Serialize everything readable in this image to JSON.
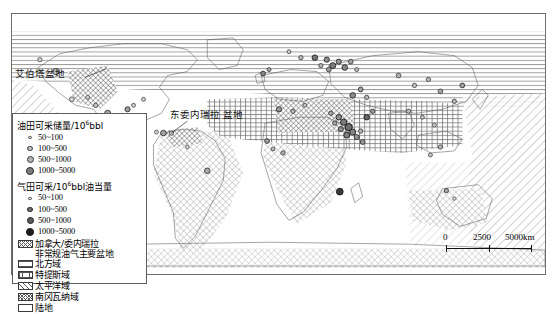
{
  "map": {
    "title_labels": [
      {
        "id": "alberta",
        "text": "艾伯塔盆地"
      }
    ],
    "venezuela": {
      "line1": "东委内瑞拉",
      "line2": "盆地"
    }
  },
  "legend": {
    "oil_header": "油田可采储量/10",
    "oil_header_sup": "6",
    "oil_header_tail": "bbl",
    "gas_header": "气田可采/10",
    "gas_header_sup": "6",
    "gas_header_tail": "bbl油当量",
    "oil_classes": [
      {
        "label": "50~100",
        "symbol": "oil-circle-xs"
      },
      {
        "label": "100~500",
        "symbol": "oil-circle-s"
      },
      {
        "label": "500~1000",
        "symbol": "oil-circle-m"
      },
      {
        "label": "1000~5000",
        "symbol": "oil-circle-l"
      }
    ],
    "gas_classes": [
      {
        "label": "50~100",
        "symbol": "gas-circle-xs"
      },
      {
        "label": "100~500",
        "symbol": "gas-circle-s"
      },
      {
        "label": "500~1000",
        "symbol": "gas-circle-m"
      },
      {
        "label": "1000~5000",
        "symbol": "gas-circle-l"
      }
    ],
    "patterns": [
      {
        "label_line1": "加拿大/委内瑞拉",
        "label_line2": "非常规油气主要盆地",
        "swatch": "cross-hatch-swatch"
      },
      {
        "label_line1": "北方域",
        "label_line2": "",
        "swatch": "horizontal-lines-swatch"
      },
      {
        "label_line1": "特提斯域",
        "label_line2": "",
        "swatch": "grid-swatch"
      },
      {
        "label_line1": "太平洋域",
        "label_line2": "",
        "swatch": "diagonal-lines-swatch"
      },
      {
        "label_line1": "南冈瓦纳域",
        "label_line2": "",
        "swatch": "x-hatch-swatch"
      },
      {
        "label_line1": "陆地",
        "label_line2": "",
        "swatch": "plain-swatch"
      }
    ]
  },
  "scalebar": {
    "t0": "0",
    "t1": "2500",
    "t2": "5000km"
  },
  "colors": {
    "frame": "#6f6f6f",
    "hatch": "#555555",
    "oil_fill": "#b4b4b4",
    "gas_fill": "#1f1f1f",
    "land": "#ffffff"
  }
}
